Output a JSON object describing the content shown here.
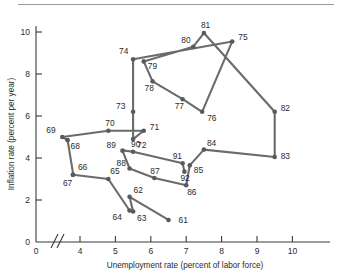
{
  "figure": {
    "kind": "scatter-line-plot",
    "marker_color": "#5a5a5a",
    "line_color": "#6b6b6b",
    "axis_color": "#3a3a3a",
    "background": "#ffffff",
    "rule_color": "#9a9a9a"
  },
  "chart_data": {
    "type": "line",
    "title": "",
    "subtitle": "",
    "xlabel": "Unemployment rate (percent of labor force)",
    "ylabel": "Inflation rate (percent per year)",
    "xlim": [
      3.2,
      10.6
    ],
    "ylim": [
      0,
      11.0
    ],
    "xticks": [
      0,
      4,
      5,
      6,
      7,
      8,
      9,
      10
    ],
    "xtick_labels": [
      "0",
      "4",
      "5",
      "6",
      "7",
      "8",
      "9",
      "10"
    ],
    "yticks": [
      0,
      2,
      4,
      6,
      8,
      10
    ],
    "ytick_labels": [
      "0",
      "2",
      "4",
      "6",
      "8",
      "10"
    ],
    "grid": false,
    "legend": "none",
    "axis_break": {
      "axis": "x",
      "between": [
        0,
        4
      ],
      "symbol": "//"
    },
    "point_label_field": "year",
    "series": [
      {
        "name": "Phillips curve path 1961-1992",
        "x": [
          6.5,
          5.4,
          5.5,
          5.4,
          4.8,
          3.8,
          3.8,
          3.65,
          3.5,
          4.8,
          5.8,
          5.5,
          5.5,
          5.5,
          8.3,
          7.45,
          6.9,
          6.05,
          5.8,
          7.2,
          7.5,
          9.5,
          9.5,
          7.5,
          7.1,
          7.0,
          6.1,
          5.4,
          5.2,
          5.25,
          5.5,
          6.9,
          6.95
        ],
        "y": [
          1.05,
          2.15,
          1.45,
          1.5,
          3.0,
          3.2,
          3.3,
          4.85,
          5.0,
          5.3,
          5.3,
          4.9,
          6.2,
          8.7,
          9.55,
          6.2,
          6.8,
          7.65,
          8.6,
          9.3,
          9.95,
          6.2,
          4.05,
          4.4,
          3.65,
          2.7,
          3.05,
          3.5,
          4.35,
          4.35,
          4.3,
          3.75,
          3.35
        ],
        "labels": [
          "61",
          "62",
          "63",
          "64",
          "65",
          "66",
          "67",
          "68",
          "69",
          "70",
          "71",
          "72",
          "73",
          "74",
          "75",
          "76",
          "77",
          "78",
          "79",
          "80",
          "81",
          "82",
          "83",
          "84",
          "85",
          "86",
          "87",
          "88",
          "89",
          "90",
          "90b",
          "91",
          "92"
        ]
      }
    ],
    "points": [
      {
        "year": "61",
        "x": 6.5,
        "y": 1.05,
        "label_dx": 10,
        "label_dy": 3
      },
      {
        "year": "62",
        "x": 5.4,
        "y": 2.15,
        "label_dx": 4,
        "label_dy": -4
      },
      {
        "year": "63",
        "x": 5.5,
        "y": 1.45,
        "label_dx": 4,
        "label_dy": 9
      },
      {
        "year": "64",
        "x": 5.4,
        "y": 1.5,
        "label_dx": -17,
        "label_dy": 9
      },
      {
        "year": "65",
        "x": 4.8,
        "y": 3.0,
        "label_dx": 2,
        "label_dy": -5
      },
      {
        "year": "66",
        "x": 3.8,
        "y": 3.2,
        "label_dx": 5,
        "label_dy": -5
      },
      {
        "year": "67",
        "x": 3.8,
        "y": 3.2,
        "label_dx": -10,
        "label_dy": 11
      },
      {
        "year": "68",
        "x": 3.65,
        "y": 4.85,
        "label_dx": 3,
        "label_dy": 9
      },
      {
        "year": "69",
        "x": 3.5,
        "y": 5.0,
        "label_dx": -16,
        "label_dy": -4
      },
      {
        "year": "70",
        "x": 4.8,
        "y": 5.3,
        "label_dx": -3,
        "label_dy": -5
      },
      {
        "year": "71",
        "x": 5.8,
        "y": 5.3,
        "label_dx": 6,
        "label_dy": -1
      },
      {
        "year": "72",
        "x": 5.5,
        "y": 4.9,
        "label_dx": 4,
        "label_dy": 9
      },
      {
        "year": "73",
        "x": 5.5,
        "y": 6.2,
        "label_dx": -17,
        "label_dy": -3
      },
      {
        "year": "74",
        "x": 5.5,
        "y": 8.7,
        "label_dx": -14,
        "label_dy": -5
      },
      {
        "year": "75",
        "x": 8.3,
        "y": 9.55,
        "label_dx": 6,
        "label_dy": -1
      },
      {
        "year": "76",
        "x": 7.45,
        "y": 6.2,
        "label_dx": 5,
        "label_dy": 9
      },
      {
        "year": "77",
        "x": 6.9,
        "y": 6.8,
        "label_dx": -8,
        "label_dy": 10
      },
      {
        "year": "78",
        "x": 6.05,
        "y": 7.65,
        "label_dx": -8,
        "label_dy": 10
      },
      {
        "year": "79",
        "x": 5.8,
        "y": 8.6,
        "label_dx": 4,
        "label_dy": 8
      },
      {
        "year": "80",
        "x": 7.2,
        "y": 9.3,
        "label_dx": -12,
        "label_dy": -4
      },
      {
        "year": "81",
        "x": 7.5,
        "y": 9.95,
        "label_dx": -3,
        "label_dy": -5
      },
      {
        "year": "82",
        "x": 9.5,
        "y": 6.2,
        "label_dx": 6,
        "label_dy": -1
      },
      {
        "year": "83",
        "x": 9.5,
        "y": 4.05,
        "label_dx": 6,
        "label_dy": 2
      },
      {
        "year": "84",
        "x": 7.5,
        "y": 4.4,
        "label_dx": 3,
        "label_dy": -4
      },
      {
        "year": "85",
        "x": 7.1,
        "y": 3.65,
        "label_dx": 4,
        "label_dy": 8
      },
      {
        "year": "86",
        "x": 7.0,
        "y": 2.7,
        "label_dx": 1,
        "label_dy": 10
      },
      {
        "year": "87",
        "x": 6.1,
        "y": 3.05,
        "label_dx": -4,
        "label_dy": -4
      },
      {
        "year": "88",
        "x": 5.4,
        "y": 3.5,
        "label_dx": -13,
        "label_dy": -3
      },
      {
        "year": "89",
        "x": 5.2,
        "y": 4.35,
        "label_dx": -16,
        "label_dy": -3
      },
      {
        "year": "90",
        "x": 5.5,
        "y": 4.3,
        "label_dx": -2,
        "label_dy": -5
      },
      {
        "year": "91",
        "x": 6.9,
        "y": 3.75,
        "label_dx": -10,
        "label_dy": -4
      },
      {
        "year": "92",
        "x": 6.95,
        "y": 3.35,
        "label_dx": -4,
        "label_dy": 9
      }
    ]
  }
}
